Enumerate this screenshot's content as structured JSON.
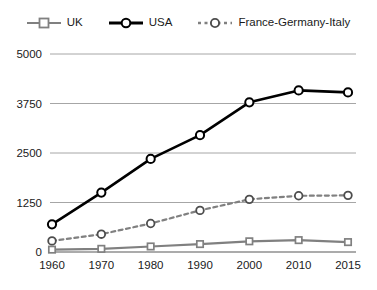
{
  "chart_data": {
    "type": "line",
    "title": "",
    "subtitle": "",
    "xlabel": "",
    "ylabel": "",
    "categories": [
      "1960",
      "1970",
      "1980",
      "1990",
      "2000",
      "2010",
      "2015"
    ],
    "x_tick_labels": [
      "1960",
      "1970",
      "1980",
      "1990",
      "2000",
      "2010",
      "2015"
    ],
    "y_tick_labels": [
      "0",
      "1250",
      "2500",
      "3750",
      "5000"
    ],
    "y_ticks": [
      0,
      1250,
      2500,
      3750,
      5000
    ],
    "ylim": [
      0,
      5000
    ],
    "grid": "horizontal",
    "legend_position": "top-center",
    "series": [
      {
        "name": "UK",
        "color": "#808080",
        "marker": "square",
        "line_style": "solid",
        "values": [
          60,
          80,
          140,
          200,
          270,
          300,
          250
        ]
      },
      {
        "name": "USA",
        "color": "#000000",
        "marker": "circle",
        "line_style": "solid",
        "values": [
          700,
          1500,
          2350,
          2950,
          3780,
          4080,
          4030
        ]
      },
      {
        "name": "France-Germany-Italy",
        "color": "#808080",
        "marker": "circle",
        "line_style": "dotted",
        "values": [
          280,
          450,
          720,
          1050,
          1330,
          1420,
          1430
        ]
      }
    ]
  },
  "legend": {
    "items": [
      {
        "label": "UK",
        "swatch_name": "legend-swatch-uk"
      },
      {
        "label": "USA",
        "swatch_name": "legend-swatch-usa"
      },
      {
        "label": "France-Germany-Italy",
        "swatch_name": "legend-swatch-france-germany-italy"
      }
    ]
  },
  "axes": {
    "y_labels": [
      "5000",
      "3750",
      "2500",
      "1250",
      "0"
    ],
    "x_labels": [
      "1960",
      "1970",
      "1980",
      "1990",
      "2000",
      "2010",
      "2015"
    ]
  },
  "colors": {
    "usa": "#000000",
    "uk": "#808080",
    "fgi": "#808080",
    "grid": "#a6a6a6",
    "axis": "#595959",
    "text": "#1a1a1a",
    "background": "#ffffff"
  }
}
